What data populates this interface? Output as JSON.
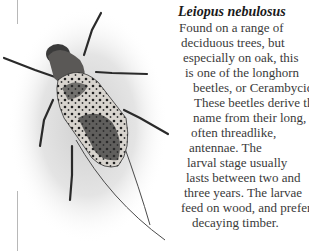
{
  "figure": {
    "image_alt": "Photograph of a Leiopus nebulosus longhorn beetle seen from above",
    "title": "Leiopus nebulosus",
    "body_lines": [
      "Found on a range of",
      "deciduous trees, but",
      "especially on oak, this",
      "is one of the longhorn",
      "beetles, or Cerambycida",
      "These beetles derive th",
      "name from their long,",
      "often threadlike,",
      "antennae. The",
      "larval stage usually",
      "lasts between two and",
      "three years. The larvae",
      "feed on wood, and prefer",
      "decaying timber."
    ]
  }
}
